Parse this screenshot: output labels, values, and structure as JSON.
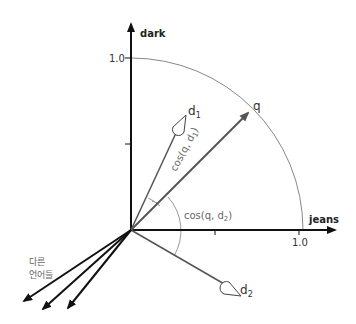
{
  "axes": {
    "y_label": "dark",
    "x_label": "jeans",
    "y_tick_label": "1.0",
    "x_tick_label": "1.0"
  },
  "vectors": {
    "q_label": "q",
    "d1_label": "d",
    "d1_sub": "1",
    "d2_label": "d",
    "d2_sub": "2"
  },
  "angles": {
    "cos_q_d1": "cos(q, d",
    "cos_q_d1_sub": "1",
    "cos_q_d1_close": ")",
    "cos_q_d2": "cos(q, d",
    "cos_q_d2_sub": "2",
    "cos_q_d2_close": ")"
  },
  "other_languages": {
    "line1": "다른",
    "line2": "언어들"
  },
  "colors": {
    "axis": "#111111",
    "vector": "#555555",
    "arc": "#888888",
    "text": "#222222",
    "muted_text": "#666666"
  }
}
